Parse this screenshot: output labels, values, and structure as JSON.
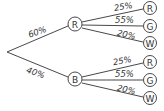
{
  "tree": {
    "first_level": [
      {
        "node": "R",
        "probability": "60%"
      },
      {
        "node": "B",
        "probability": "40%"
      }
    ],
    "second_level": {
      "R": [
        {
          "node": "R",
          "probability": "25%"
        },
        {
          "node": "G",
          "probability": "55%"
        },
        {
          "node": "W",
          "probability": "20%"
        }
      ],
      "B": [
        {
          "node": "R",
          "probability": "25%"
        },
        {
          "node": "G",
          "probability": "55%"
        },
        {
          "node": "W",
          "probability": "20%"
        }
      ]
    }
  }
}
